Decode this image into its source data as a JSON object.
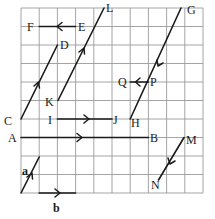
{
  "diagram": {
    "type": "vector-grid",
    "grid": {
      "cols": 10,
      "rows": 10,
      "line_color": "#9a9a9a"
    },
    "ink_color": "#1a1a1a",
    "points": {
      "A": "A",
      "B": "B",
      "C": "C",
      "D": "D",
      "E": "E",
      "F": "F",
      "G": "G",
      "H": "H",
      "I": "I",
      "J": "J",
      "K": "K",
      "L": "L",
      "M": "M",
      "N": "N",
      "P": "P",
      "Q": "Q"
    },
    "vectors": [
      {
        "name": "EF",
        "from": "E",
        "to": "F",
        "direction": "left"
      },
      {
        "name": "CD",
        "from": "C",
        "to": "D",
        "direction": "up-right"
      },
      {
        "name": "KL",
        "from": "K",
        "to": "L",
        "direction": "up-right"
      },
      {
        "name": "GH",
        "from": "G",
        "to": "H",
        "direction": "down-left"
      },
      {
        "name": "PQ",
        "from": "P",
        "to": "Q",
        "direction": "left"
      },
      {
        "name": "IJ",
        "from": "I",
        "to": "J",
        "direction": "right"
      },
      {
        "name": "AB",
        "from": "A",
        "to": "B",
        "direction": "right"
      },
      {
        "name": "MN",
        "from": "M",
        "to": "N",
        "direction": "down-left"
      },
      {
        "name": "a",
        "direction": "up-right"
      },
      {
        "name": "b",
        "direction": "right"
      }
    ],
    "free_vectors": {
      "a": "a",
      "b": "b"
    }
  }
}
